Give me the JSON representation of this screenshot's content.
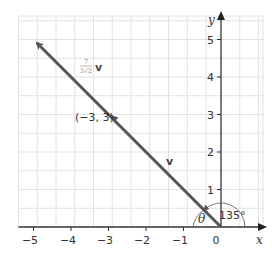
{
  "diagram": {
    "type": "coordinate-plane-vector",
    "axes": {
      "x_label": "x",
      "y_label": "y",
      "x_ticks": [
        "−5",
        "−4",
        "−3",
        "−2",
        "−1",
        "0"
      ],
      "y_ticks": [
        "1",
        "2",
        "3",
        "4",
        "5"
      ],
      "x_range": [
        -5.5,
        1.1
      ],
      "y_range": [
        0,
        5.6
      ]
    },
    "vectors": [
      {
        "name": "v",
        "label": "v",
        "from": [
          0,
          0
        ],
        "to": [
          -3,
          3
        ]
      },
      {
        "name": "scaled_v",
        "label_num": "7",
        "label_den": "3√2",
        "label_vec": "v",
        "from": [
          0,
          0
        ],
        "to": [
          -5,
          5
        ]
      }
    ],
    "points": [
      {
        "label": "(−3, 3)",
        "x": -3,
        "y": 3
      }
    ],
    "angles": [
      {
        "label": "135°",
        "value": 135
      },
      {
        "label": "θ"
      }
    ],
    "colors": {
      "vector": "#555555",
      "grid": "#e2e2e2",
      "axis": "#333333",
      "fraction_label": "#8a8a8a"
    }
  }
}
